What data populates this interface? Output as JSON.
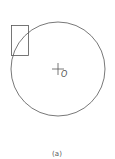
{
  "figure": {
    "center_label": "O",
    "caption": "(a)",
    "stroke_color": "#555555",
    "circle": {
      "cx": 58,
      "cy": 69,
      "r": 47
    },
    "rect": {
      "x": 11,
      "y": 25,
      "w": 17,
      "h": 30
    }
  }
}
